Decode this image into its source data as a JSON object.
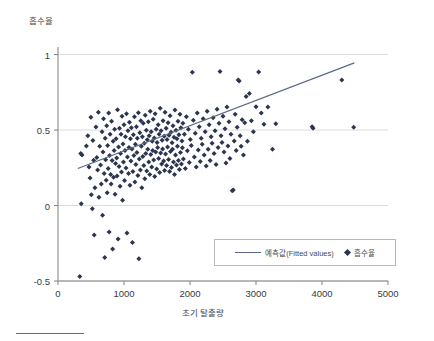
{
  "chart_data": {
    "type": "scatter",
    "title": "",
    "xlabel": "초기 탈출량",
    "ylabel": "흡수율",
    "xlim": [
      0,
      5000
    ],
    "ylim": [
      -0.5,
      1.05
    ],
    "xticks": [
      0,
      1000,
      2000,
      3000,
      4000,
      5000
    ],
    "xtick_labels": [
      "0",
      "1000",
      "2000",
      "3000",
      "4000",
      "5000"
    ],
    "yticks": [
      -0.5,
      0,
      0.5,
      1
    ],
    "ytick_labels": [
      "-0.5",
      "0",
      "0.5",
      "1"
    ],
    "grid": "horizontal",
    "legend_position": "lower-right",
    "marker": "diamond",
    "marker_color": "#2c3550",
    "line_color": "#5a6a86",
    "gridline_color": "#dcdcdc",
    "axis_color": "#8a8a8a",
    "series": [
      {
        "name": "예측값(Fitted values)",
        "type": "line",
        "x": [
          300,
          4490
        ],
        "y": [
          0.245,
          0.945
        ]
      },
      {
        "name": "흡수율",
        "type": "scatter",
        "points": [
          [
            330,
            -0.47
          ],
          [
            345,
            0.345
          ],
          [
            352,
            0.012
          ],
          [
            365,
            0.335
          ],
          [
            430,
            0.395
          ],
          [
            452,
            0.462
          ],
          [
            470,
            0.255
          ],
          [
            486,
            0.182
          ],
          [
            498,
            0.585
          ],
          [
            505,
            0.072
          ],
          [
            520,
            -0.022
          ],
          [
            528,
            0.43
          ],
          [
            540,
            0.3
          ],
          [
            548,
            -0.195
          ],
          [
            560,
            0.118
          ],
          [
            575,
            0.52
          ],
          [
            588,
            0.318
          ],
          [
            600,
            0.235
          ],
          [
            612,
            0.618
          ],
          [
            620,
            0.055
          ],
          [
            632,
            0.392
          ],
          [
            645,
            0.268
          ],
          [
            655,
            0.142
          ],
          [
            668,
            0.488
          ],
          [
            675,
            -0.065
          ],
          [
            682,
            0.355
          ],
          [
            690,
            0.575
          ],
          [
            700,
            0.212
          ],
          [
            708,
            -0.345
          ],
          [
            715,
            0.445
          ],
          [
            722,
            0.303
          ],
          [
            730,
            0.168
          ],
          [
            738,
            0.528
          ],
          [
            745,
            0.085
          ],
          [
            752,
            0.398
          ],
          [
            760,
            0.245
          ],
          [
            768,
            0.612
          ],
          [
            775,
            -0.175
          ],
          [
            782,
            0.332
          ],
          [
            790,
            0.472
          ],
          [
            798,
            0.205
          ],
          [
            805,
            0.142
          ],
          [
            812,
            0.558
          ],
          [
            820,
            0.298
          ],
          [
            828,
            -0.288
          ],
          [
            835,
            0.425
          ],
          [
            842,
            0.188
          ],
          [
            850,
            0.365
          ],
          [
            858,
            0.505
          ],
          [
            865,
            0.075
          ],
          [
            872,
            0.278
          ],
          [
            880,
            0.442
          ],
          [
            888,
            0.315
          ],
          [
            895,
            0.195
          ],
          [
            902,
            0.635
          ],
          [
            910,
            -0.222
          ],
          [
            918,
            0.388
          ],
          [
            925,
            0.258
          ],
          [
            932,
            0.512
          ],
          [
            940,
            0.128
          ],
          [
            948,
            0.345
          ],
          [
            955,
            0.472
          ],
          [
            962,
            0.222
          ],
          [
            970,
            0.592
          ],
          [
            978,
            0.035
          ],
          [
            985,
            0.408
          ],
          [
            992,
            0.288
          ],
          [
            1000,
            0.535
          ],
          [
            1008,
            0.165
          ],
          [
            1015,
            0.365
          ],
          [
            1022,
            0.455
          ],
          [
            1030,
            0.248
          ],
          [
            1038,
            0.608
          ],
          [
            1045,
            -0.182
          ],
          [
            1052,
            0.322
          ],
          [
            1060,
            0.495
          ],
          [
            1068,
            0.212
          ],
          [
            1075,
            0.385
          ],
          [
            1082,
            0.552
          ],
          [
            1090,
            0.135
          ],
          [
            1098,
            0.442
          ],
          [
            1105,
            0.295
          ],
          [
            1112,
            0.515
          ],
          [
            1120,
            0.375
          ],
          [
            1128,
            -0.245
          ],
          [
            1135,
            0.225
          ],
          [
            1142,
            0.468
          ],
          [
            1150,
            0.332
          ],
          [
            1158,
            0.588
          ],
          [
            1165,
            0.155
          ],
          [
            1172,
            0.405
          ],
          [
            1180,
            0.272
          ],
          [
            1188,
            0.522
          ],
          [
            1195,
            0.352
          ],
          [
            1202,
            0.445
          ],
          [
            1210,
            0.198
          ],
          [
            1218,
            0.615
          ],
          [
            1225,
            -0.352
          ],
          [
            1232,
            0.308
          ],
          [
            1240,
            0.482
          ],
          [
            1248,
            0.235
          ],
          [
            1255,
            0.562
          ],
          [
            1262,
            0.392
          ],
          [
            1270,
            0.118
          ],
          [
            1278,
            0.455
          ],
          [
            1285,
            0.325
          ],
          [
            1292,
            0.545
          ],
          [
            1300,
            0.265
          ],
          [
            1308,
            0.412
          ],
          [
            1315,
            0.178
          ],
          [
            1322,
            0.598
          ],
          [
            1330,
            0.345
          ],
          [
            1338,
            0.498
          ],
          [
            1345,
            0.228
          ],
          [
            1352,
            0.435
          ],
          [
            1360,
            0.372
          ],
          [
            1368,
            0.555
          ],
          [
            1375,
            0.288
          ],
          [
            1382,
            0.462
          ],
          [
            1390,
            0.205
          ],
          [
            1398,
            0.625
          ],
          [
            1405,
            0.338
          ],
          [
            1412,
            0.488
          ],
          [
            1420,
            0.255
          ],
          [
            1428,
            0.425
          ],
          [
            1435,
            0.365
          ],
          [
            1442,
            0.572
          ],
          [
            1450,
            0.302
          ],
          [
            1458,
            0.448
          ],
          [
            1465,
            0.192
          ],
          [
            1472,
            0.608
          ],
          [
            1480,
            0.355
          ],
          [
            1488,
            0.505
          ],
          [
            1495,
            0.242
          ],
          [
            1502,
            0.418
          ],
          [
            1510,
            0.385
          ],
          [
            1518,
            0.535
          ],
          [
            1525,
            0.312
          ],
          [
            1532,
            0.472
          ],
          [
            1540,
            0.218
          ],
          [
            1548,
            0.645
          ],
          [
            1555,
            0.348
          ],
          [
            1562,
            0.495
          ],
          [
            1570,
            0.275
          ],
          [
            1578,
            0.432
          ],
          [
            1585,
            0.375
          ],
          [
            1592,
            0.562
          ],
          [
            1600,
            0.295
          ],
          [
            1608,
            0.458
          ],
          [
            1615,
            0.232
          ],
          [
            1622,
            0.618
          ],
          [
            1630,
            0.342
          ],
          [
            1638,
            0.512
          ],
          [
            1645,
            0.265
          ],
          [
            1652,
            0.438
          ],
          [
            1660,
            0.388
          ],
          [
            1668,
            0.548
          ],
          [
            1675,
            0.305
          ],
          [
            1682,
            0.465
          ],
          [
            1690,
            0.225
          ],
          [
            1698,
            0.595
          ],
          [
            1705,
            0.358
          ],
          [
            1712,
            0.485
          ],
          [
            1720,
            0.252
          ],
          [
            1728,
            0.415
          ],
          [
            1735,
            0.372
          ],
          [
            1742,
            0.528
          ],
          [
            1750,
            0.288
          ],
          [
            1758,
            0.452
          ],
          [
            1765,
            0.205
          ],
          [
            1772,
            0.632
          ],
          [
            1780,
            0.335
          ],
          [
            1788,
            0.498
          ],
          [
            1795,
            0.268
          ],
          [
            1802,
            0.442
          ],
          [
            1810,
            0.392
          ],
          [
            1818,
            0.558
          ],
          [
            1825,
            0.298
          ],
          [
            1832,
            0.468
          ],
          [
            1840,
            0.238
          ],
          [
            1848,
            0.605
          ],
          [
            1855,
            0.352
          ],
          [
            1862,
            0.515
          ],
          [
            1870,
            0.275
          ],
          [
            1878,
            0.428
          ],
          [
            1885,
            0.382
          ],
          [
            1892,
            0.545
          ],
          [
            1900,
            0.308
          ],
          [
            1915,
            0.472
          ],
          [
            1930,
            0.245
          ],
          [
            1945,
            0.588
          ],
          [
            1960,
            0.362
          ],
          [
            1975,
            0.505
          ],
          [
            1990,
            0.285
          ],
          [
            2005,
            0.438
          ],
          [
            2020,
            0.398
          ],
          [
            2035,
            0.882
          ],
          [
            2050,
            0.565
          ],
          [
            2065,
            0.322
          ],
          [
            2080,
            0.478
          ],
          [
            2095,
            0.255
          ],
          [
            2110,
            0.612
          ],
          [
            2125,
            0.368
          ],
          [
            2140,
            0.522
          ],
          [
            2155,
            0.292
          ],
          [
            2170,
            0.445
          ],
          [
            2185,
            0.405
          ],
          [
            2200,
            0.575
          ],
          [
            2215,
            0.335
          ],
          [
            2230,
            0.488
          ],
          [
            2245,
            0.262
          ],
          [
            2260,
            0.625
          ],
          [
            2275,
            0.372
          ],
          [
            2290,
            0.535
          ],
          [
            2305,
            0.298
          ],
          [
            2320,
            0.455
          ],
          [
            2335,
            0.412
          ],
          [
            2350,
            0.582
          ],
          [
            2365,
            0.345
          ],
          [
            2380,
            0.495
          ],
          [
            2395,
            0.272
          ],
          [
            2410,
            0.638
          ],
          [
            2425,
            0.385
          ],
          [
            2440,
            0.545
          ],
          [
            2455,
            0.888
          ],
          [
            2470,
            0.462
          ],
          [
            2485,
            0.418
          ],
          [
            2500,
            0.592
          ],
          [
            2515,
            0.355
          ],
          [
            2530,
            0.508
          ],
          [
            2545,
            0.282
          ],
          [
            2560,
            0.652
          ],
          [
            2575,
            0.395
          ],
          [
            2590,
            0.555
          ],
          [
            2605,
            0.312
          ],
          [
            2620,
            0.472
          ],
          [
            2640,
            0.098
          ],
          [
            2655,
            0.102
          ],
          [
            2670,
            0.428
          ],
          [
            2685,
            0.605
          ],
          [
            2700,
            0.365
          ],
          [
            2715,
            0.518
          ],
          [
            2730,
            0.832
          ],
          [
            2745,
            0.825
          ],
          [
            2760,
            0.462
          ],
          [
            2775,
            0.392
          ],
          [
            2790,
            0.568
          ],
          [
            2810,
            0.335
          ],
          [
            2830,
            0.548
          ],
          [
            2850,
            0.722
          ],
          [
            2870,
            0.425
          ],
          [
            2900,
            0.742
          ],
          [
            2930,
            0.562
          ],
          [
            2960,
            0.488
          ],
          [
            3000,
            0.655
          ],
          [
            3040,
            0.885
          ],
          [
            3080,
            0.612
          ],
          [
            3120,
            0.538
          ],
          [
            3180,
            0.652
          ],
          [
            3250,
            0.372
          ],
          [
            3300,
            0.542
          ],
          [
            3850,
            0.522
          ],
          [
            3865,
            0.512
          ],
          [
            4300,
            0.832
          ],
          [
            4480,
            0.518
          ]
        ]
      }
    ]
  },
  "axis_titles": {
    "y": "흡수율",
    "x": "초기 탈출량"
  },
  "legend": {
    "entries": [
      {
        "label": "예측값(Fitted values)",
        "marker": "line"
      },
      {
        "label": "흡수율",
        "marker": "diamond"
      }
    ]
  }
}
